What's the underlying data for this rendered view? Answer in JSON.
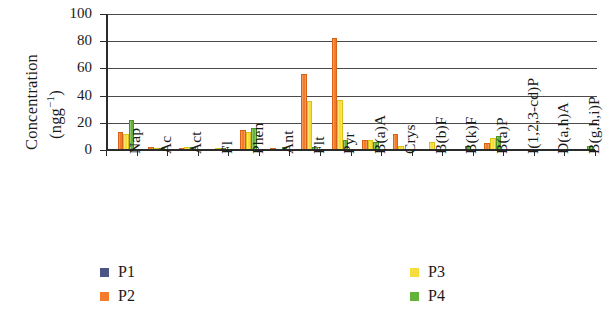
{
  "chart_data": {
    "type": "bar",
    "title": "",
    "xlabel": "",
    "ylabel": "Concentration (ngg⁻¹)",
    "ylabel_line1": "Concentration",
    "ylabel_line2_pre": "(ngg",
    "ylabel_line2_sup": "−1",
    "ylabel_line2_post": ")",
    "ylim": [
      0,
      100
    ],
    "yticks": [
      0,
      20,
      40,
      60,
      80,
      100
    ],
    "ytick_labels": [
      "0",
      "20",
      "40",
      "60",
      "80",
      "100"
    ],
    "grid": true,
    "grid_axis": "y",
    "legend_position": "bottom",
    "categories": [
      "Nap",
      "Ac",
      "Act",
      "Fl",
      "Phen",
      "Ant",
      "Flt",
      "Pyr",
      "B(a)A",
      "Crys",
      "B(b)F",
      "B(k)F",
      "B(a)P",
      "I(1,2,3-cd)P",
      "D(a,h)A",
      "B(g,h,i)P"
    ],
    "series": [
      {
        "name": "P1",
        "color": "#4b5684",
        "values": [
          0,
          0,
          0,
          0,
          0,
          0,
          0,
          0,
          0,
          0,
          0,
          0,
          0,
          0,
          0,
          0
        ]
      },
      {
        "name": "P2",
        "color": "#f47b2a",
        "values": [
          13,
          2,
          1.5,
          0,
          15,
          1,
          56,
          82,
          7,
          12,
          0,
          0,
          5,
          0,
          0,
          0
        ]
      },
      {
        "name": "P3",
        "color": "#f6dd3c",
        "values": [
          12,
          1,
          2,
          1,
          13,
          0,
          36,
          37,
          7,
          3,
          6,
          0,
          9,
          0,
          0,
          0
        ]
      },
      {
        "name": "P4",
        "color": "#63b33b",
        "values": [
          22,
          1,
          2.5,
          1.5,
          16,
          2,
          2,
          7,
          6,
          0,
          0,
          3,
          10,
          0,
          0,
          3
        ]
      }
    ]
  },
  "legend": {
    "items": [
      {
        "label": "P1",
        "color": "#4b5684"
      },
      {
        "label": "P2",
        "color": "#f47b2a"
      },
      {
        "label": "P3",
        "color": "#f6dd3c"
      },
      {
        "label": "P4",
        "color": "#63b33b"
      }
    ]
  }
}
